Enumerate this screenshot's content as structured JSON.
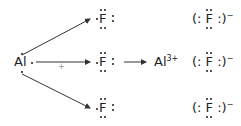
{
  "diagram": {
    "reactant_metal": {
      "symbol": "Al",
      "valence_electrons": 3
    },
    "reactant_nonmetal": {
      "symbol": "F",
      "valence_electrons": 7,
      "count": 3
    },
    "plus_sign": "+",
    "reaction_arrow": "→",
    "product_cation": {
      "symbol": "Al",
      "charge": "3+"
    },
    "product_anion": {
      "open": "(:",
      "symbol": "F",
      "close": ":)",
      "charge": "−",
      "count": 3
    },
    "colors": {
      "text": "#222222",
      "arrow": "#333333",
      "plus": "#999999"
    }
  }
}
